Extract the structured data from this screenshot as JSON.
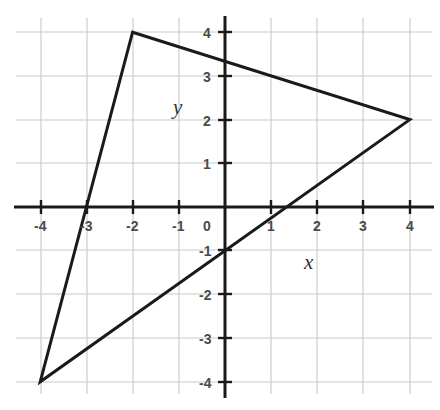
{
  "figure": {
    "title": "",
    "background_color": "#ffffff"
  },
  "chart_data": {
    "type": "line",
    "title": "",
    "xlabel": "x",
    "ylabel": "y",
    "xlim": [
      -4.3,
      4.7
    ],
    "ylim": [
      -4.4,
      4.4
    ],
    "grid": true,
    "grid_color": "#c9c9c9",
    "axis_color": "#1a1a1a",
    "legend": "none",
    "xticks": [
      -4,
      -3,
      -2,
      -1,
      0,
      1,
      2,
      3,
      4
    ],
    "yticks": [
      4,
      3,
      2,
      1,
      -1,
      -2,
      -3,
      -4
    ],
    "xtick_labels": [
      "-4",
      "-3",
      "-2",
      "-1",
      "0",
      "1",
      "2",
      "3",
      "4"
    ],
    "ytick_labels": [
      "4",
      "3",
      "2",
      "1",
      "-1",
      "-2",
      "-3",
      "-4"
    ],
    "series": [
      {
        "name": "triangle",
        "shape": "closed-polygon",
        "color": "#1a1a1a",
        "linewidth": 3,
        "points": [
          {
            "x": -2,
            "y": 4
          },
          {
            "x": 4,
            "y": 2
          },
          {
            "x": -4,
            "y": -4
          }
        ],
        "vertex_labels": [
          "(-2, 4)",
          "(4, 2)",
          "(-4, -4)"
        ]
      }
    ],
    "annotations": []
  },
  "axis_labels": {
    "x": "x",
    "y": "y"
  },
  "x_tick_values": [
    "-4",
    "-3",
    "-2",
    "-1",
    "0",
    "1",
    "2",
    "3",
    "4"
  ],
  "y_tick_values": [
    "4",
    "3",
    "2",
    "1",
    "-1",
    "-2",
    "-3",
    "-4"
  ]
}
